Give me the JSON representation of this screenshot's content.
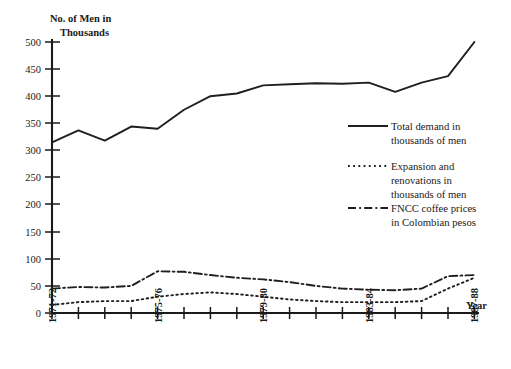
{
  "chart_data": {
    "type": "line",
    "title": "",
    "ylabel": "No. of Men in Thousands",
    "xlabel": "Year",
    "ylim": [
      0,
      500
    ],
    "yticks": [
      0,
      50,
      100,
      150,
      200,
      250,
      300,
      350,
      400,
      450,
      500
    ],
    "grid": false,
    "legend_position": "center-right",
    "x": [
      "1971-72",
      "1972-73",
      "1973-74",
      "1974-75",
      "1975-76",
      "1976-77",
      "1977-78",
      "1978-79",
      "1979-80",
      "1980-81",
      "1981-82",
      "1982-83",
      "1983-84",
      "1984-85",
      "1985-86",
      "1986-87",
      "1987-88"
    ],
    "xtick_labels": [
      "1971-72",
      "",
      "",
      "",
      "1975-76",
      "",
      "",
      "",
      "1979-80",
      "",
      "",
      "",
      "1983-84",
      "",
      "",
      "",
      "1987-88"
    ],
    "series": [
      {
        "name": "Total demand in thousands of men",
        "style": "solid",
        "values": [
          315,
          337,
          318,
          344,
          340,
          375,
          400,
          405,
          420,
          422,
          424,
          423,
          425,
          408,
          425,
          437,
          500
        ]
      },
      {
        "name": "Expansion and renovations in thousands of men",
        "style": "dotted",
        "values": [
          15,
          20,
          22,
          22,
          30,
          35,
          38,
          35,
          30,
          25,
          22,
          20,
          20,
          20,
          22,
          45,
          65
        ]
      },
      {
        "name": "FNCC coffee prices in Colombian pesos",
        "style": "dash-dot",
        "values": [
          45,
          48,
          47,
          50,
          77,
          76,
          70,
          65,
          62,
          57,
          50,
          45,
          43,
          42,
          45,
          68,
          70
        ]
      }
    ]
  },
  "legend": {
    "entries": [
      {
        "label_line1": "Total demand in",
        "label_line2": "thousands of men",
        "style": "solid"
      },
      {
        "label_line1": "Expansion and",
        "label_line2": "renovations in",
        "label_line3": "thousands of men",
        "style": "dotted"
      },
      {
        "label_line1": "FNCC coffee prices",
        "label_line2": "in Colombian pesos",
        "style": "dash-dot"
      }
    ]
  },
  "axes": {
    "y_title_line1": "No. of Men in",
    "y_title_line2": "Thousands",
    "x_title": "Year",
    "y_tick_labels": [
      "500",
      "450",
      "400",
      "350",
      "300",
      "250",
      "200",
      "150",
      "100",
      "50",
      "0"
    ],
    "x_tick_labels": [
      "1971-72",
      "1975-76",
      "1979-80",
      "1983-84",
      "1987-88"
    ]
  }
}
